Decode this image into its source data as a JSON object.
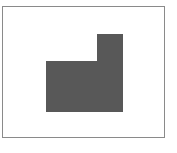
{
  "figure": {
    "frame_color": "#8a8a8a",
    "shape_color": "#585858",
    "shape": "L-shaped polygon (lower rectangle with raised right column)"
  }
}
